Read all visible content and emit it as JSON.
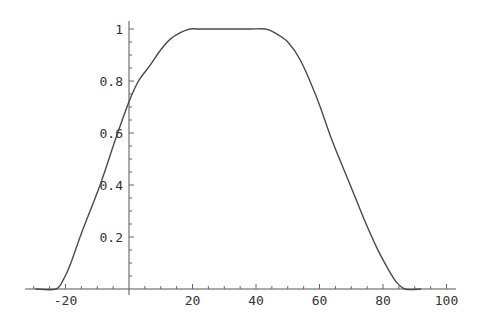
{
  "chart_data": {
    "type": "line",
    "title": "",
    "xlabel": "",
    "ylabel": "",
    "xlim": [
      -32,
      102
    ],
    "ylim": [
      -0.02,
      1.03
    ],
    "grid": false,
    "legend": null,
    "x_ticks": [
      -20,
      20,
      40,
      60,
      80,
      100
    ],
    "x_tick_labels": [
      "-20",
      "20",
      "40",
      "60",
      "80",
      "100"
    ],
    "y_ticks": [
      0.2,
      0.4,
      0.6,
      0.8,
      1
    ],
    "y_tick_labels": [
      "0.2",
      "0.4",
      "0.6",
      "0.8",
      "1"
    ],
    "series": [
      {
        "name": "curve",
        "color": "#4a4a4a",
        "x": [
          -29.5,
          -23,
          -20.5,
          -18.6,
          -14.8,
          -9.1,
          -4.4,
          0,
          3,
          6.6,
          10,
          12.9,
          16,
          19.2,
          22,
          30,
          38,
          43,
          46,
          50,
          54,
          59,
          64,
          69,
          74,
          78,
          81,
          84,
          87,
          92
        ],
        "y": [
          0,
          0,
          0.04,
          0.09,
          0.22,
          0.4,
          0.57,
          0.72,
          0.8,
          0.86,
          0.92,
          0.96,
          0.985,
          1,
          1,
          1,
          1,
          1,
          0.985,
          0.95,
          0.88,
          0.74,
          0.57,
          0.42,
          0.27,
          0.16,
          0.09,
          0.03,
          0,
          0
        ]
      }
    ]
  }
}
